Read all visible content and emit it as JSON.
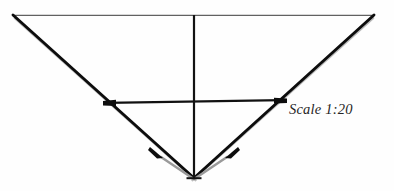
{
  "document": {
    "kind": "scanned-line-drawing",
    "background_color": "#fefefe",
    "width": 394,
    "height": 191
  },
  "annotations": {
    "scale_label": "Scale 1:20"
  },
  "palette": {
    "ink_black": "#0d0d0d",
    "ink_dark": "#1a1a1a",
    "ink_gray": "#9a9a9a",
    "ink_light_gray": "#b8b8b8",
    "hairline": "#3a3a3a",
    "paper": "#fefefe",
    "text": "#262626"
  },
  "geometry": {
    "top_edge": {
      "name": "top-horizontal-line",
      "x1": 13,
      "y1": 15,
      "x2": 374,
      "y2": 15,
      "stroke_width": 1,
      "color": "#3a3a3a"
    },
    "left_diagonal": {
      "name": "left-diagonal-edge",
      "x1": 13,
      "y1": 15,
      "x2": 194,
      "y2": 178,
      "stroke_width": 3,
      "color": "#0d0d0d"
    },
    "right_diagonal": {
      "name": "right-diagonal-edge",
      "x1": 374,
      "y1": 15,
      "x2": 194,
      "y2": 178,
      "stroke_width": 3,
      "color": "#0d0d0d"
    },
    "left_diagonal_shadow": {
      "name": "left-diagonal-shadow",
      "x1": 15,
      "y1": 18,
      "x2": 195,
      "y2": 180,
      "stroke_width": 2,
      "color": "#b8b8b8"
    },
    "right_diagonal_shadow": {
      "name": "right-diagonal-shadow",
      "x1": 373,
      "y1": 18,
      "x2": 193,
      "y2": 180,
      "stroke_width": 2,
      "color": "#b8b8b8"
    },
    "vertical_axis": {
      "name": "vertical-center-axis",
      "x1": 194,
      "y1": 15,
      "x2": 194,
      "y2": 178,
      "stroke_width": 2.2,
      "color": "#121212"
    },
    "apex_tick": {
      "name": "apex-terminator-tick",
      "x1": 186,
      "y1": 178,
      "x2": 202,
      "y2": 178,
      "stroke_width": 2,
      "color": "#121212"
    },
    "crossbar": {
      "name": "horizontal-crossbar",
      "x1": 106,
      "y1": 103,
      "x2": 283,
      "y2": 100,
      "stroke_width": 2.2,
      "color": "#111111"
    },
    "crossbar_left_arrow": {
      "name": "crossbar-left-arrowhead",
      "cx": 106,
      "cy": 103
    },
    "crossbar_right_arrow": {
      "name": "crossbar-right-arrowhead",
      "cx": 283,
      "cy": 100
    },
    "left_lower_tick": {
      "name": "left-lower-diagonal-tick",
      "cx": 160,
      "cy": 156
    },
    "right_lower_tick": {
      "name": "right-lower-diagonal-tick",
      "cx": 228,
      "cy": 156
    },
    "left_lower_segment": {
      "name": "left-lower-gray-segment",
      "x1": 160,
      "y1": 157,
      "x2": 193,
      "y2": 178,
      "stroke_width": 2,
      "color": "#9a9a9a"
    },
    "right_lower_segment": {
      "name": "right-lower-gray-segment",
      "x1": 228,
      "y1": 157,
      "x2": 195,
      "y2": 178,
      "stroke_width": 2,
      "color": "#9a9a9a"
    }
  }
}
